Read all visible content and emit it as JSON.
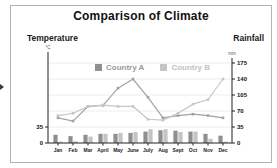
{
  "title": "Comparison of Climate",
  "left_axis": {
    "label": "Temperature",
    "unit": "°C",
    "ticks": [
      "35",
      "0"
    ]
  },
  "right_axis": {
    "label": "Rainfall",
    "unit": "mm",
    "ticks": [
      "175",
      "140",
      "105",
      "70",
      "35",
      "0"
    ]
  },
  "legend": [
    {
      "label": "Country A",
      "color": "#8f8f8f",
      "text_color": "#9a9a9a"
    },
    {
      "label": "Country B",
      "color": "#c4c4c4",
      "text_color": "#c2c2c2"
    }
  ],
  "chart_data": {
    "type": "combo-line-bar",
    "categories": [
      "Jan",
      "Feb",
      "Mar",
      "April",
      "May",
      "June",
      "July",
      "Aug",
      "Sept",
      "Oct",
      "Nov",
      "Dec"
    ],
    "lines": [
      {
        "name": "Country A",
        "axis": "right (mm)",
        "color": "#a2a2a2",
        "values": [
          55,
          48,
          80,
          82,
          120,
          140,
          100,
          55,
          60,
          63,
          60,
          55
        ]
      },
      {
        "name": "Country B",
        "axis": "right (mm)",
        "color": "#c6c6c6",
        "values": [
          60,
          65,
          80,
          83,
          80,
          80,
          52,
          50,
          65,
          85,
          95,
          140
        ]
      }
    ],
    "bars": [
      {
        "name": "Country A",
        "axis": "left (°C)",
        "color": "#8f8f8f",
        "values": [
          18,
          15,
          18,
          20,
          20,
          22,
          25,
          28,
          27,
          25,
          20,
          16
        ]
      },
      {
        "name": "Country B",
        "axis": "left (°C)",
        "color": "#c4c4c4",
        "values": [
          3,
          4,
          14,
          20,
          22,
          24,
          30,
          30,
          24,
          25,
          9,
          3
        ]
      }
    ],
    "right_axis_range": [
      0,
      175
    ],
    "left_axis_labeled_ticks": [
      35,
      0
    ],
    "grid": "faint horizontal lines every 35 units",
    "legend_position": "top-center"
  }
}
